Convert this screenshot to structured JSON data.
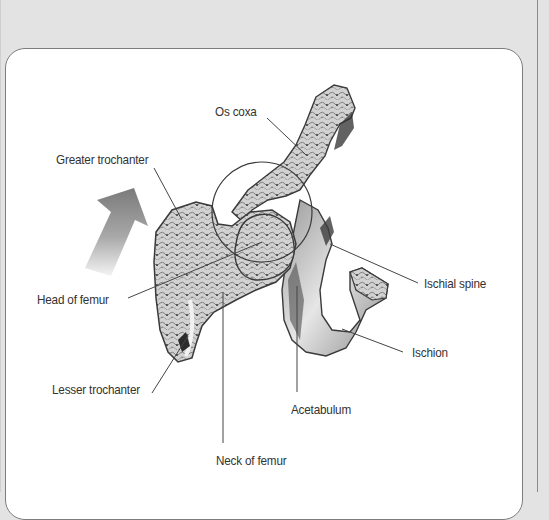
{
  "figure": {
    "labels": {
      "os_coxa": "Os coxa",
      "greater_trochanter": "Greater trochanter",
      "head_of_femur": "Head of femur",
      "lesser_trochanter": "Lesser trochanter",
      "ischial_spine": "Ischial spine",
      "ischion": "Ischion",
      "acetabulum": "Acetabulum",
      "neck_of_femur": "Neck of femur"
    },
    "arrow": {
      "direction": "up-right",
      "icon": "movement-arrow-icon"
    },
    "highlight": {
      "shape": "circle",
      "icon": "joint-highlight-circle"
    }
  },
  "colors": {
    "page_background": "#e3e3e3",
    "card_background": "#ffffff",
    "card_border": "#7d7d7d",
    "label_text": "#333333",
    "leader_line": "#444444",
    "bone_fill": "#c9c9c9",
    "bone_outline": "#3a3a3a"
  }
}
